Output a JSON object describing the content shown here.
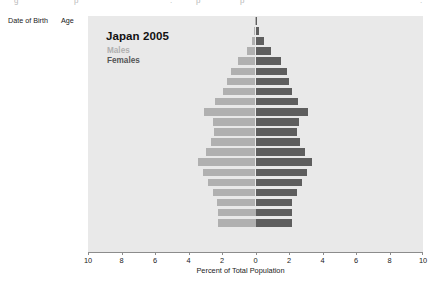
{
  "caption_remnant": {
    "parts": [
      "g",
      "p",
      ".",
      "p",
      "p",
      "."
    ]
  },
  "table": {
    "headers": {
      "date_of_birth": "Date of Birth",
      "age": "Age"
    },
    "rows": [
      {
        "dob": "< 1905",
        "age": "100+"
      },
      {
        "dob": "1906 - 1910",
        "age": "95 - 99"
      },
      {
        "dob": "1911 - 1915",
        "age": "90 - 94"
      },
      {
        "dob": "1916 - 1920",
        "age": "85 - 89"
      },
      {
        "dob": "1921 - 1925",
        "age": "80 - 84"
      },
      {
        "dob": "1926 - 1930",
        "age": "75 - 79"
      },
      {
        "dob": "1931 - 1935",
        "age": "70 - 74"
      },
      {
        "dob": "1936 - 1940",
        "age": "65 - 69"
      },
      {
        "dob": "1941 - 1945",
        "age": "60 - 64"
      },
      {
        "dob": "1946 - 1950",
        "age": "55 - 59"
      },
      {
        "dob": "1951 - 1955",
        "age": "50 - 54"
      },
      {
        "dob": "1956 - 1960",
        "age": "45 - 49"
      },
      {
        "dob": "1961 - 1965",
        "age": "40 - 44"
      },
      {
        "dob": "1966 - 1970",
        "age": "35 - 39"
      },
      {
        "dob": "1971 - 1975",
        "age": "30 - 34"
      },
      {
        "dob": "1976 - 1980",
        "age": "25 - 29"
      },
      {
        "dob": "1981 - 1985",
        "age": "20 - 24"
      },
      {
        "dob": "1986 - 1990",
        "age": "15 - 19"
      },
      {
        "dob": "1991 - 1995",
        "age": "10 - 14"
      },
      {
        "dob": "1996 - 2000",
        "age": "5 - 9"
      },
      {
        "dob": "2001 - 2005",
        "age": "0 - 4"
      }
    ]
  },
  "colors": {
    "males": "#b0b0b0",
    "females": "#5e5e5e",
    "plot_background": "#e9e9e9",
    "page_background": "#ffffff",
    "axis": "#8c8c8c"
  },
  "chart_data": {
    "type": "bar",
    "subtype": "population-pyramid",
    "title": "Japan 2005",
    "xlabel": "Percent of Total Population",
    "ylabel": "",
    "xlim": [
      -10,
      10
    ],
    "xticks": [
      10,
      8,
      6,
      4,
      2,
      0,
      2,
      4,
      6,
      8,
      10
    ],
    "grid": false,
    "legend": [
      "Males",
      "Females"
    ],
    "legend_position": "top-left-inside",
    "categories": [
      "100+",
      "95 - 99",
      "90 - 94",
      "85 - 89",
      "80 - 84",
      "75 - 79",
      "70 - 74",
      "65 - 69",
      "60 - 64",
      "55 - 59",
      "50 - 54",
      "45 - 49",
      "40 - 44",
      "35 - 39",
      "30 - 34",
      "25 - 29",
      "20 - 24",
      "15 - 19",
      "10 - 14",
      "5 - 9",
      "0 - 4"
    ],
    "series": [
      {
        "name": "Males",
        "side": "left",
        "color": "#b0b0b0",
        "values": [
          0.01,
          0.06,
          0.22,
          0.52,
          1.02,
          1.45,
          1.7,
          1.95,
          2.4,
          3.05,
          2.55,
          2.45,
          2.65,
          2.95,
          3.45,
          3.15,
          2.85,
          2.55,
          2.3,
          2.25,
          2.25
        ]
      },
      {
        "name": "Females",
        "side": "right",
        "color": "#5e5e5e",
        "values": [
          0.04,
          0.18,
          0.5,
          0.95,
          1.55,
          1.9,
          2.0,
          2.15,
          2.55,
          3.15,
          2.6,
          2.5,
          2.65,
          2.95,
          3.4,
          3.1,
          2.8,
          2.45,
          2.2,
          2.15,
          2.15
        ]
      }
    ]
  }
}
